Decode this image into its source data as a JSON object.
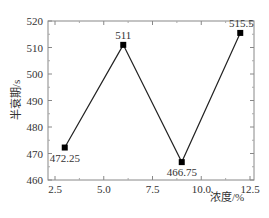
{
  "chart_data": {
    "type": "line",
    "title": "",
    "xlabel": "浓度/%",
    "ylabel": "半衰期/s",
    "x": [
      3,
      6,
      9,
      12
    ],
    "series": [
      {
        "name": "半衰期",
        "values": [
          472.25,
          511,
          466.75,
          515.5
        ],
        "labels": [
          "472.25",
          "511",
          "466.75",
          "515.5"
        ],
        "marker": "square",
        "color": "#222222"
      }
    ],
    "xlim": [
      2,
      13
    ],
    "ylim": [
      460,
      520
    ],
    "xticks": [
      2.5,
      5.0,
      7.5,
      10.0,
      12.5
    ],
    "xtick_labels": [
      "2.5",
      "5.0",
      "7.5",
      "10.0",
      "12.5"
    ],
    "yticks": [
      460,
      470,
      480,
      490,
      500,
      510,
      520
    ],
    "ytick_labels": [
      "460",
      "470",
      "480",
      "490",
      "500",
      "510",
      "520"
    ],
    "grid": false,
    "legend": "none"
  }
}
